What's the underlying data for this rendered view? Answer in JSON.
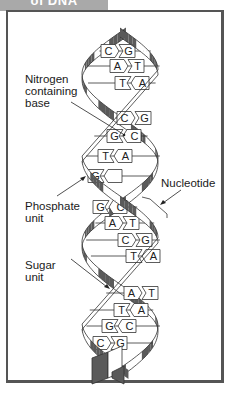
{
  "header": {
    "title": "of DNA"
  },
  "labels": {
    "nitrogen_base": [
      "Nitrogen",
      "containing",
      "base"
    ],
    "phosphate": [
      "Phosphate",
      "unit"
    ],
    "nucleotide": [
      "Nucleotide"
    ],
    "sugar": [
      "Sugar",
      "unit"
    ]
  },
  "base_pairs": [
    {
      "left": "C",
      "right": "G"
    },
    {
      "left": "A",
      "right": "T"
    },
    {
      "left": "T",
      "right": "A"
    },
    {
      "left": "C",
      "right": "G"
    },
    {
      "left": "G",
      "right": "C"
    },
    {
      "left": "T",
      "right": "A"
    },
    {
      "left": "G",
      "right": ""
    },
    {
      "left": "G",
      "right": "C"
    },
    {
      "left": "A",
      "right": "T"
    },
    {
      "left": "C",
      "right": "G"
    },
    {
      "left": "T",
      "right": "A"
    },
    {
      "left": "A",
      "right": "T"
    },
    {
      "left": "T",
      "right": "A"
    },
    {
      "left": "G",
      "right": "C"
    },
    {
      "left": "C",
      "right": "G"
    }
  ],
  "colors": {
    "strand_dark": "#5a5a5a",
    "strand_light": "#ffffff",
    "outline": "#333333",
    "header_bg": "#a9a9a9"
  }
}
